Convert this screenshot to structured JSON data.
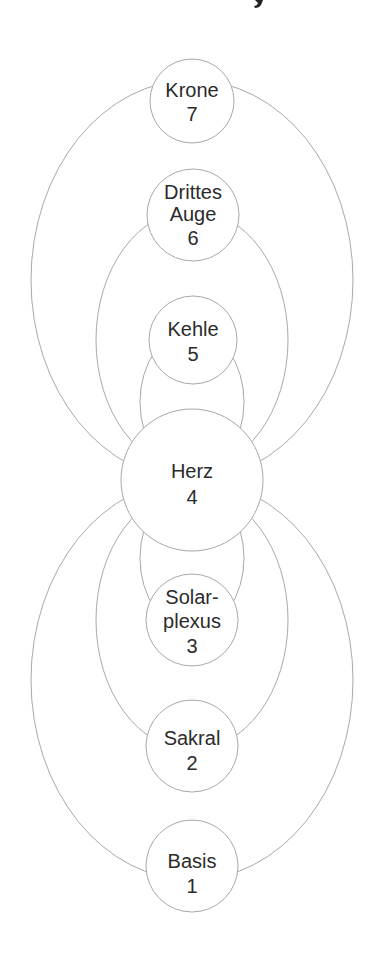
{
  "title_fragment": "y",
  "colors": {
    "line": "#a8a8a8",
    "text": "#2b2b2b",
    "background": "#ffffff",
    "node_fill": "#ffffff"
  },
  "nodes": [
    {
      "id": "krone",
      "lines": [
        "Krone",
        "7"
      ],
      "number": 7
    },
    {
      "id": "drittes-auge",
      "lines": [
        "Drittes",
        "Auge",
        "6"
      ],
      "number": 6
    },
    {
      "id": "kehle",
      "lines": [
        "Kehle",
        "5"
      ],
      "number": 5
    },
    {
      "id": "herz",
      "lines": [
        "Herz",
        "4"
      ],
      "number": 4
    },
    {
      "id": "solarplexus",
      "lines": [
        "Solar-",
        "plexus",
        "3"
      ],
      "number": 3
    },
    {
      "id": "sakral",
      "lines": [
        "Sakral",
        "2"
      ],
      "number": 2
    },
    {
      "id": "basis",
      "lines": [
        "Basis",
        "1"
      ],
      "number": 1
    }
  ],
  "connections": [
    {
      "from": "krone",
      "to": "herz"
    },
    {
      "from": "drittes-auge",
      "to": "herz"
    },
    {
      "from": "kehle",
      "to": "herz"
    },
    {
      "from": "herz",
      "to": "solarplexus"
    },
    {
      "from": "herz",
      "to": "sakral"
    },
    {
      "from": "herz",
      "to": "basis"
    }
  ]
}
